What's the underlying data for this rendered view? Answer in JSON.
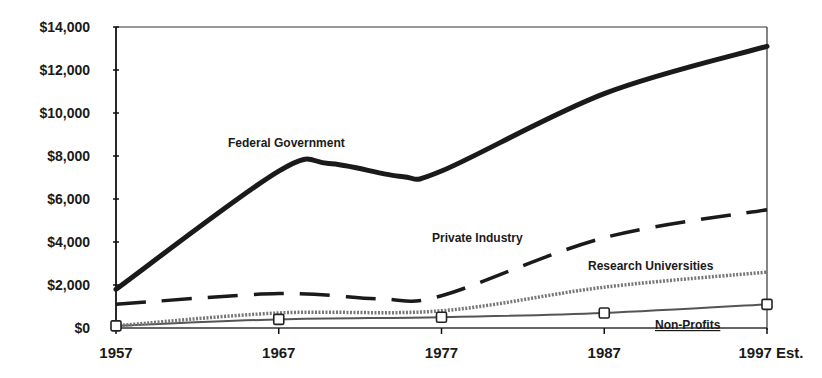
{
  "chart_data": {
    "type": "line",
    "title": "",
    "xlabel": "",
    "ylabel": "",
    "categories": [
      "1957",
      "1967",
      "1977",
      "1987",
      "1997 Est."
    ],
    "y_tick_labels": [
      "$0",
      "$2,000",
      "$4,000",
      "$6,000",
      "$8,000",
      "$10,000",
      "$12,000",
      "$14,000"
    ],
    "ylim": [
      0,
      14000
    ],
    "grid": false,
    "legend": "inline labels",
    "series": [
      {
        "name": "Federal Government",
        "style": "solid-thick",
        "values": [
          1800,
          7300,
          7300,
          10900,
          13100
        ]
      },
      {
        "name": "Private Industry",
        "style": "dashed",
        "values": [
          1100,
          1600,
          1500,
          4200,
          5500
        ]
      },
      {
        "name": "Research Universities",
        "style": "dotted-gray",
        "values": [
          100,
          700,
          800,
          1900,
          2600
        ]
      },
      {
        "name": "Non-Profits",
        "style": "thin-with-square-markers",
        "values": [
          100,
          400,
          500,
          700,
          1100
        ]
      }
    ],
    "labels": {
      "federal": "Federal Government",
      "private": "Private Industry",
      "universities": "Research Universities",
      "nonprofits": "Non-Profits"
    }
  }
}
